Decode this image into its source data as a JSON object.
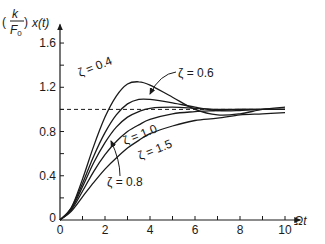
{
  "chart_data": {
    "type": "line",
    "title": "",
    "xlabel": "Ωt",
    "ylabel": "(k/F0) x(t)",
    "ylabel_parts": {
      "num": "k",
      "den": "F",
      "den_sub": "0",
      "rest": "x(t)"
    },
    "xlim": [
      0,
      10.5
    ],
    "ylim": [
      0,
      1.75
    ],
    "x_ticks": [
      0,
      1,
      2,
      3,
      4,
      5,
      6,
      7,
      8,
      9,
      10
    ],
    "x_tick_labels": [
      {
        "v": 0,
        "t": "0"
      },
      {
        "v": 2,
        "t": "2"
      },
      {
        "v": 4,
        "t": "4"
      },
      {
        "v": 6,
        "t": "6"
      },
      {
        "v": 8,
        "t": "8"
      },
      {
        "v": 10,
        "t": "10"
      }
    ],
    "y_ticks": [
      0,
      0.2,
      0.4,
      0.6,
      0.8,
      1.0,
      1.2,
      1.4,
      1.6
    ],
    "y_tick_labels": [
      {
        "v": 0,
        "t": "0"
      },
      {
        "v": 0.4,
        "t": "0.4"
      },
      {
        "v": 0.8,
        "t": "0.8"
      },
      {
        "v": 1.2,
        "t": "1.2"
      },
      {
        "v": 1.6,
        "t": "1.6"
      }
    ],
    "reference_line": {
      "y": 1.0,
      "style": "dashed"
    },
    "grid": false,
    "x": [
      0,
      0.5,
      1,
      1.5,
      2,
      2.5,
      3,
      3.5,
      4,
      5,
      6,
      7,
      8,
      9,
      10
    ],
    "series": [
      {
        "name": "ζ = 0.4",
        "values": [
          0,
          0.11,
          0.37,
          0.67,
          0.93,
          1.12,
          1.23,
          1.25,
          1.22,
          1.11,
          1.0,
          0.95,
          0.96,
          1.0,
          1.02
        ]
      },
      {
        "name": "ζ = 0.6",
        "values": [
          0,
          0.11,
          0.33,
          0.58,
          0.79,
          0.95,
          1.05,
          1.09,
          1.09,
          1.06,
          1.02,
          0.99,
          0.99,
          1.0,
          1.0
        ]
      },
      {
        "name": "ζ = 0.8",
        "values": [
          0,
          0.1,
          0.3,
          0.52,
          0.7,
          0.84,
          0.93,
          0.98,
          1.01,
          1.02,
          1.01,
          1.0,
          1.0,
          1.0,
          1.0
        ]
      },
      {
        "name": "ζ = 1.0",
        "values": [
          0,
          0.09,
          0.26,
          0.44,
          0.59,
          0.71,
          0.8,
          0.86,
          0.91,
          0.96,
          0.98,
          0.99,
          1.0,
          1.0,
          1.0
        ]
      },
      {
        "name": "ζ = 1.5",
        "values": [
          0,
          0.08,
          0.21,
          0.34,
          0.46,
          0.56,
          0.65,
          0.72,
          0.78,
          0.85,
          0.9,
          0.92,
          0.95,
          0.96,
          0.97
        ]
      }
    ],
    "annotations": [
      {
        "text": "ζ = 0.4",
        "x": 80,
        "y": 77,
        "rotate": -22
      },
      {
        "text": "ζ = 0.6",
        "x": 178,
        "y": 77,
        "rotate": 0
      },
      {
        "text": "ζ = 1.0",
        "x": 125,
        "y": 145,
        "rotate": -22
      },
      {
        "text": "ζ = 1.5",
        "x": 140,
        "y": 160,
        "rotate": -22
      },
      {
        "text": "ζ = 0.8",
        "x": 107,
        "y": 186,
        "rotate": 0
      }
    ],
    "arrows": [
      {
        "from": [
          176,
          72
        ],
        "c": [
          160,
          74
        ],
        "to": [
          150,
          94
        ],
        "label": "ζ = 0.6"
      },
      {
        "from": [
          120,
          176
        ],
        "c": [
          120,
          160
        ],
        "to": [
          111,
          141
        ],
        "label": "ζ = 0.8"
      }
    ],
    "line_color": "#1a1a1a"
  }
}
